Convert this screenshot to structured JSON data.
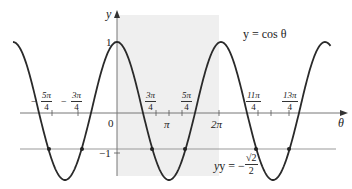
{
  "chart_data": {
    "type": "line",
    "title": "",
    "xlabel": "θ",
    "ylabel": "y",
    "series": [
      {
        "name": "y = cos θ",
        "function": "cos",
        "x_range": [
          -6.2832,
          12.9
        ],
        "color": "#333333"
      },
      {
        "name": "y = -√2/2",
        "function": "constant",
        "value": -0.7071,
        "color": "#999999"
      }
    ],
    "x_tick_labels": [
      "-5π/4",
      "-3π/4",
      "0",
      "3π/4",
      "π",
      "5π/4",
      "2π",
      "11π/4",
      "13π/4"
    ],
    "x_ticks": [
      -3.927,
      -2.356,
      0,
      2.356,
      3.1416,
      3.927,
      6.2832,
      8.639,
      10.21
    ],
    "y_tick_labels": [
      "1",
      "-1"
    ],
    "y_ticks": [
      1,
      -1
    ],
    "intersection_points": [
      {
        "label": "-5π/4",
        "x": -3.927,
        "y": -0.7071
      },
      {
        "label": "-3π/4",
        "x": -2.356,
        "y": -0.7071
      },
      {
        "label": "3π/4",
        "x": 2.356,
        "y": -0.7071
      },
      {
        "label": "5π/4",
        "x": 3.927,
        "y": -0.7071
      },
      {
        "label": "11π/4",
        "x": 8.639,
        "y": -0.7071
      },
      {
        "label": "13π/4",
        "x": 10.21,
        "y": -0.7071
      }
    ],
    "shaded_region": {
      "x_from": 0,
      "x_to": 6.2832,
      "color": "#eeeeee"
    },
    "annotations": [
      "y = cos θ",
      "y = -√2/2"
    ],
    "grid": false,
    "legend": "none"
  },
  "labels": {
    "y_axis": "y",
    "x_axis": "θ",
    "curve": "y = cos θ",
    "line_prefix": "y = −",
    "line_num": "√2",
    "line_den": "2",
    "one": "1",
    "minus_one": "−1",
    "zero": "0",
    "pi": "π",
    "two_pi": "2π",
    "t1_num": "5π",
    "t1_den": "4",
    "t2_num": "3π",
    "t2_den": "4",
    "t3_num": "3π",
    "t3_den": "4",
    "t4_num": "5π",
    "t4_den": "4",
    "t5_num": "11π",
    "t5_den": "4",
    "t6_num": "13π",
    "t6_den": "4",
    "minus": "−"
  }
}
